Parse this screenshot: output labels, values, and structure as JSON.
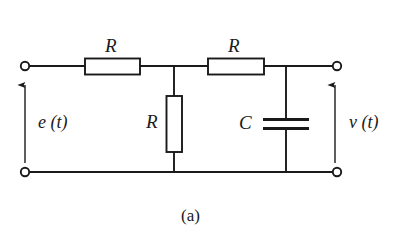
{
  "figure": {
    "caption": "(a)",
    "type": "electrical-circuit-schematic",
    "background_color": "#ffffff",
    "line_color": "#1a1a1a"
  },
  "labels": {
    "resistor_series_left": "R",
    "resistor_shunt_middle": "R",
    "resistor_series_right": "R",
    "capacitor_shunt": "C",
    "input_voltage": "e (t)",
    "output_voltage": "v (t)"
  },
  "components": [
    {
      "id": "R1",
      "kind": "resistor",
      "label": "R",
      "orientation": "horizontal",
      "position": "top-left-branch"
    },
    {
      "id": "R2",
      "kind": "resistor",
      "label": "R",
      "orientation": "vertical",
      "position": "middle-shunt"
    },
    {
      "id": "R3",
      "kind": "resistor",
      "label": "R",
      "orientation": "horizontal",
      "position": "top-right-branch"
    },
    {
      "id": "C1",
      "kind": "capacitor",
      "label": "C",
      "orientation": "vertical",
      "position": "right-shunt"
    }
  ],
  "terminals": [
    {
      "id": "input-top",
      "label": "",
      "side": "left",
      "rail": "top"
    },
    {
      "id": "input-bottom",
      "label": "",
      "side": "left",
      "rail": "bottom"
    },
    {
      "id": "output-top",
      "label": "",
      "side": "right",
      "rail": "top"
    },
    {
      "id": "output-bottom",
      "label": "",
      "side": "right",
      "rail": "bottom"
    }
  ],
  "arrows": [
    {
      "id": "input-arrow",
      "label": "e (t)",
      "direction": "up",
      "side": "left"
    },
    {
      "id": "output-arrow",
      "label": "v (t)",
      "direction": "up",
      "side": "right"
    }
  ]
}
